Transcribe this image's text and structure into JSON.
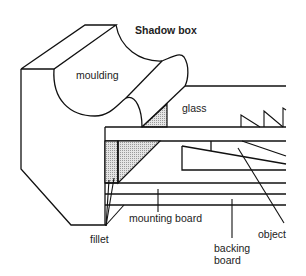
{
  "title": "Shadow box",
  "labels": {
    "moulding": "moulding",
    "glass": "glass",
    "fillet": "fillet",
    "mounting_board": "mounting board",
    "backing_board_line1": "backing",
    "backing_board_line2": "board",
    "object": "object"
  },
  "colors": {
    "line": "#111111",
    "shading": "#bdbdbd",
    "background": "#ffffff"
  }
}
